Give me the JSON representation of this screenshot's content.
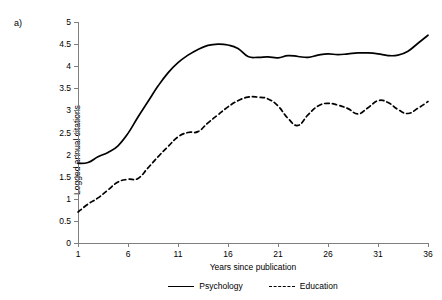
{
  "panel": {
    "label": "a)"
  },
  "chart_data": {
    "type": "line",
    "title": "",
    "xlabel": "Years since publication",
    "ylabel": "Logged annual citations",
    "xlim": [
      1,
      36
    ],
    "ylim": [
      0,
      5
    ],
    "xticks": [
      1,
      6,
      11,
      16,
      21,
      26,
      31,
      36
    ],
    "yticks": [
      0,
      0.5,
      1,
      1.5,
      2,
      2.5,
      3,
      3.5,
      4,
      4.5,
      5
    ],
    "ytick_labels": [
      "0",
      "0.5",
      "1",
      "1.5",
      "2",
      "2.5",
      "3",
      "3.5",
      "4",
      "4.5",
      "5"
    ],
    "xtick_labels": [
      "1",
      "6",
      "11",
      "16",
      "21",
      "26",
      "31",
      "36"
    ],
    "grid": false,
    "legend_position": "bottom",
    "x": [
      1,
      2,
      3,
      4,
      5,
      6,
      7,
      8,
      9,
      10,
      11,
      12,
      13,
      14,
      15,
      16,
      17,
      18,
      19,
      20,
      21,
      22,
      23,
      24,
      25,
      26,
      27,
      28,
      29,
      30,
      31,
      32,
      33,
      34,
      35,
      36
    ],
    "series": [
      {
        "name": "Psychology",
        "style": "solid",
        "color": "#000000",
        "values": [
          1.8,
          1.82,
          1.95,
          2.05,
          2.2,
          2.48,
          2.85,
          3.2,
          3.55,
          3.85,
          4.08,
          4.25,
          4.38,
          4.47,
          4.5,
          4.48,
          4.4,
          4.22,
          4.2,
          4.21,
          4.19,
          4.24,
          4.22,
          4.2,
          4.25,
          4.28,
          4.26,
          4.28,
          4.3,
          4.3,
          4.28,
          4.24,
          4.25,
          4.34,
          4.52,
          4.7
        ]
      },
      {
        "name": "Education",
        "style": "dashed",
        "color": "#000000",
        "values": [
          0.7,
          0.88,
          1.02,
          1.2,
          1.38,
          1.44,
          1.46,
          1.7,
          1.95,
          2.18,
          2.4,
          2.5,
          2.52,
          2.72,
          2.9,
          3.08,
          3.22,
          3.3,
          3.3,
          3.26,
          3.1,
          2.82,
          2.66,
          2.9,
          3.1,
          3.16,
          3.12,
          3.04,
          2.92,
          3.06,
          3.22,
          3.18,
          3.02,
          2.93,
          3.05,
          3.2
        ]
      }
    ]
  },
  "legend": {
    "items": [
      {
        "label": "Psychology",
        "style": "solid"
      },
      {
        "label": "Education",
        "style": "dashed"
      }
    ]
  }
}
